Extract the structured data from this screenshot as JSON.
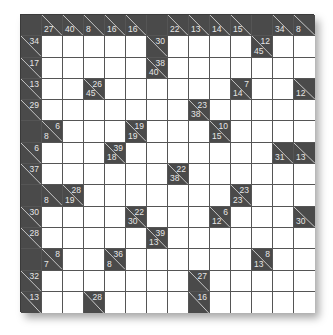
{
  "puzzle": {
    "type": "kakuro",
    "rows": 14,
    "cols": 14,
    "colors": {
      "clue_bg": "#4a4a4a",
      "clue_text": "#e6e6e6",
      "cell_bg": "#ffffff",
      "grid_line": "#555555"
    },
    "grid": [
      [
        {
          "t": "b"
        },
        {
          "t": "c",
          "d": "27"
        },
        {
          "t": "c",
          "d": "40"
        },
        {
          "t": "c",
          "d": "8"
        },
        {
          "t": "c",
          "d": "16"
        },
        {
          "t": "c",
          "d": "16"
        },
        {
          "t": "b"
        },
        {
          "t": "c",
          "d": "22"
        },
        {
          "t": "c",
          "d": "13"
        },
        {
          "t": "c",
          "d": "14"
        },
        {
          "t": "c",
          "d": "15"
        },
        {
          "t": "b"
        },
        {
          "t": "c",
          "d": "34"
        },
        {
          "t": "c",
          "d": "8"
        }
      ],
      [
        {
          "t": "c",
          "r": "34"
        },
        {
          "t": "w"
        },
        {
          "t": "w"
        },
        {
          "t": "w"
        },
        {
          "t": "w"
        },
        {
          "t": "w"
        },
        {
          "t": "c",
          "r": "30"
        },
        {
          "t": "w"
        },
        {
          "t": "w"
        },
        {
          "t": "w"
        },
        {
          "t": "w"
        },
        {
          "t": "c",
          "r": "12",
          "d": "45"
        },
        {
          "t": "w"
        },
        {
          "t": "w"
        }
      ],
      [
        {
          "t": "c",
          "r": "17"
        },
        {
          "t": "w"
        },
        {
          "t": "w"
        },
        {
          "t": "w"
        },
        {
          "t": "w"
        },
        {
          "t": "w"
        },
        {
          "t": "c",
          "r": "38",
          "d": "40"
        },
        {
          "t": "w"
        },
        {
          "t": "w"
        },
        {
          "t": "w"
        },
        {
          "t": "w"
        },
        {
          "t": "w"
        },
        {
          "t": "w"
        },
        {
          "t": "w"
        }
      ],
      [
        {
          "t": "c",
          "r": "13"
        },
        {
          "t": "w"
        },
        {
          "t": "w"
        },
        {
          "t": "c",
          "r": "26",
          "d": "45"
        },
        {
          "t": "w"
        },
        {
          "t": "w"
        },
        {
          "t": "w"
        },
        {
          "t": "w"
        },
        {
          "t": "w"
        },
        {
          "t": "w"
        },
        {
          "t": "c",
          "r": "7",
          "d": "14"
        },
        {
          "t": "w"
        },
        {
          "t": "w"
        },
        {
          "t": "c",
          "d": "12"
        }
      ],
      [
        {
          "t": "c",
          "r": "29"
        },
        {
          "t": "w"
        },
        {
          "t": "w"
        },
        {
          "t": "w"
        },
        {
          "t": "w"
        },
        {
          "t": "w"
        },
        {
          "t": "w"
        },
        {
          "t": "w"
        },
        {
          "t": "c",
          "r": "23",
          "d": "38"
        },
        {
          "t": "w"
        },
        {
          "t": "w"
        },
        {
          "t": "w"
        },
        {
          "t": "w"
        },
        {
          "t": "w"
        }
      ],
      [
        {
          "t": "b"
        },
        {
          "t": "c",
          "r": "6",
          "d": "8"
        },
        {
          "t": "w"
        },
        {
          "t": "w"
        },
        {
          "t": "w"
        },
        {
          "t": "c",
          "r": "19",
          "d": "19"
        },
        {
          "t": "w"
        },
        {
          "t": "w"
        },
        {
          "t": "w"
        },
        {
          "t": "c",
          "r": "10",
          "d": "15"
        },
        {
          "t": "w"
        },
        {
          "t": "w"
        },
        {
          "t": "w"
        },
        {
          "t": "w"
        }
      ],
      [
        {
          "t": "c",
          "r": "6"
        },
        {
          "t": "w"
        },
        {
          "t": "w"
        },
        {
          "t": "w"
        },
        {
          "t": "c",
          "r": "39",
          "d": "18"
        },
        {
          "t": "w"
        },
        {
          "t": "w"
        },
        {
          "t": "w"
        },
        {
          "t": "w"
        },
        {
          "t": "w"
        },
        {
          "t": "w"
        },
        {
          "t": "w"
        },
        {
          "t": "c",
          "d": "31"
        },
        {
          "t": "c",
          "d": "13"
        }
      ],
      [
        {
          "t": "c",
          "r": "37"
        },
        {
          "t": "w"
        },
        {
          "t": "w"
        },
        {
          "t": "w"
        },
        {
          "t": "w"
        },
        {
          "t": "w"
        },
        {
          "t": "w"
        },
        {
          "t": "c",
          "r": "22",
          "d": "38"
        },
        {
          "t": "w"
        },
        {
          "t": "w"
        },
        {
          "t": "w"
        },
        {
          "t": "w"
        },
        {
          "t": "w"
        },
        {
          "t": "w"
        }
      ],
      [
        {
          "t": "b"
        },
        {
          "t": "c",
          "d": "8"
        },
        {
          "t": "c",
          "r": "28",
          "d": "19"
        },
        {
          "t": "w"
        },
        {
          "t": "w"
        },
        {
          "t": "w"
        },
        {
          "t": "w"
        },
        {
          "t": "w"
        },
        {
          "t": "w"
        },
        {
          "t": "w"
        },
        {
          "t": "c",
          "r": "23",
          "d": "23"
        },
        {
          "t": "w"
        },
        {
          "t": "w"
        },
        {
          "t": "w"
        }
      ],
      [
        {
          "t": "c",
          "r": "30"
        },
        {
          "t": "w"
        },
        {
          "t": "w"
        },
        {
          "t": "w"
        },
        {
          "t": "w"
        },
        {
          "t": "c",
          "r": "22",
          "d": "30"
        },
        {
          "t": "w"
        },
        {
          "t": "w"
        },
        {
          "t": "w"
        },
        {
          "t": "c",
          "r": "6",
          "d": "12"
        },
        {
          "t": "w"
        },
        {
          "t": "w"
        },
        {
          "t": "w"
        },
        {
          "t": "c",
          "d": "30"
        }
      ],
      [
        {
          "t": "c",
          "r": "28"
        },
        {
          "t": "w"
        },
        {
          "t": "w"
        },
        {
          "t": "w"
        },
        {
          "t": "w"
        },
        {
          "t": "w"
        },
        {
          "t": "c",
          "r": "39",
          "d": "13"
        },
        {
          "t": "w"
        },
        {
          "t": "w"
        },
        {
          "t": "w"
        },
        {
          "t": "w"
        },
        {
          "t": "w"
        },
        {
          "t": "w"
        },
        {
          "t": "w"
        }
      ],
      [
        {
          "t": "b"
        },
        {
          "t": "c",
          "r": "8",
          "d": "7"
        },
        {
          "t": "w"
        },
        {
          "t": "w"
        },
        {
          "t": "c",
          "r": "36",
          "d": "8"
        },
        {
          "t": "w"
        },
        {
          "t": "w"
        },
        {
          "t": "w"
        },
        {
          "t": "w"
        },
        {
          "t": "w"
        },
        {
          "t": "w"
        },
        {
          "t": "c",
          "r": "8",
          "d": "13"
        },
        {
          "t": "w"
        },
        {
          "t": "w"
        }
      ],
      [
        {
          "t": "c",
          "r": "32"
        },
        {
          "t": "w"
        },
        {
          "t": "w"
        },
        {
          "t": "w"
        },
        {
          "t": "w"
        },
        {
          "t": "w"
        },
        {
          "t": "w"
        },
        {
          "t": "w"
        },
        {
          "t": "c",
          "r": "27"
        },
        {
          "t": "w"
        },
        {
          "t": "w"
        },
        {
          "t": "w"
        },
        {
          "t": "w"
        },
        {
          "t": "w"
        }
      ],
      [
        {
          "t": "c",
          "r": "13"
        },
        {
          "t": "w"
        },
        {
          "t": "w"
        },
        {
          "t": "c",
          "r": "28"
        },
        {
          "t": "w"
        },
        {
          "t": "w"
        },
        {
          "t": "w"
        },
        {
          "t": "w"
        },
        {
          "t": "c",
          "r": "16"
        },
        {
          "t": "w"
        },
        {
          "t": "w"
        },
        {
          "t": "w"
        },
        {
          "t": "w"
        },
        {
          "t": "w"
        }
      ]
    ]
  }
}
